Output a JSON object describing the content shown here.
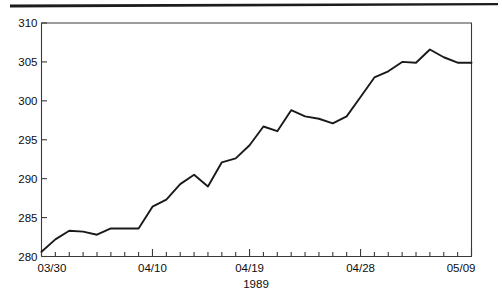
{
  "figure": {
    "background_color": "#ffffff",
    "frame_color": "#3a3a3a",
    "line_color": "#1a1a1a",
    "text_color": "#0d0d0d",
    "top_rule_color": "#1c1c1c"
  },
  "chart_data": {
    "type": "line",
    "title": "",
    "subtitle": "",
    "xlabel": "1989",
    "ylabel": "",
    "xlim": [
      "03/30",
      "05/09"
    ],
    "ylim": [
      280,
      310
    ],
    "grid": false,
    "legend": null,
    "ytick_labels": [
      "280",
      "285",
      "290",
      "295",
      "300",
      "305",
      "310"
    ],
    "ytick_values": [
      280,
      285,
      290,
      295,
      300,
      305,
      310
    ],
    "xtick_labels": [
      "03/30",
      "04/10",
      "04/19",
      "04/28",
      "05/09"
    ],
    "xtick_label_indices": [
      0,
      8,
      15,
      23,
      31
    ],
    "minor_xticks_total": 32,
    "x": [
      "03/30",
      "03/31",
      "04/03",
      "04/04",
      "04/05",
      "04/06",
      "04/07",
      "04/10",
      "04/11",
      "04/12",
      "04/13",
      "04/14",
      "04/17",
      "04/18",
      "04/19",
      "04/20",
      "04/21",
      "04/24",
      "04/25",
      "04/26",
      "04/27",
      "04/28",
      "05/01",
      "05/02",
      "05/03",
      "05/04",
      "05/05",
      "05/08",
      "05/09",
      "05/10",
      "05/11",
      "05/12"
    ],
    "series": [
      {
        "name": "Index",
        "values": [
          280.6,
          282.2,
          283.3,
          283.2,
          282.8,
          283.6,
          283.6,
          283.6,
          286.4,
          287.3,
          289.3,
          290.5,
          289.0,
          292.1,
          292.6,
          294.3,
          296.7,
          296.1,
          298.8,
          298.0,
          297.7,
          297.1,
          298.0,
          300.5,
          303.0,
          303.8,
          305.0,
          304.9,
          306.6,
          305.6,
          304.9,
          304.9
        ]
      }
    ],
    "annotations": []
  },
  "axes": {
    "x_axis_title": "1989",
    "y_axis_title": ""
  }
}
